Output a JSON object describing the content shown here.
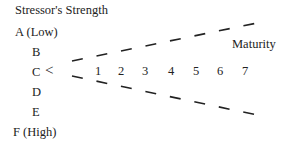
{
  "diagram": {
    "title": "Stressor's Strength",
    "levels": [
      "A (Low)",
      "B",
      "C",
      "D",
      "E",
      "F (High)"
    ],
    "vertex_symbol": "<",
    "axis_label": "Maturity",
    "maturity_steps": [
      "1",
      "2",
      "3",
      "4",
      "5",
      "6",
      "7"
    ]
  }
}
